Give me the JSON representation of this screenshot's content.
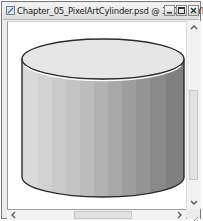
{
  "window": {
    "title": "Chapter_05_PixelArtCylinder.psd @ 300% (CYLIN...",
    "icon": "photoshop-document-icon",
    "controls": {
      "minimize": "minimize-icon",
      "maximize": "maximize-icon",
      "close": "close-icon"
    }
  },
  "canvas": {
    "background": "#ffffff",
    "artwork": {
      "shape": "cylinder",
      "outline_color": "#2a2a2a",
      "top_face_color": "#e4e4e4",
      "rim_highlight_color": "#ffffff",
      "body_bands": [
        "#d6d6d6",
        "#cecece",
        "#c6c6c6",
        "#bebebe",
        "#b4b4b4",
        "#aaaaaa",
        "#a0a0a0",
        "#969696",
        "#8c8c8c",
        "#828282",
        "#7a7a7a"
      ]
    }
  },
  "scrollbars": {
    "vertical": {
      "up": "scroll-up-arrow-icon",
      "down": "scroll-down-arrow-icon"
    },
    "horizontal": {
      "left": "scroll-left-arrow-icon",
      "right": "scroll-right-arrow-icon"
    }
  }
}
